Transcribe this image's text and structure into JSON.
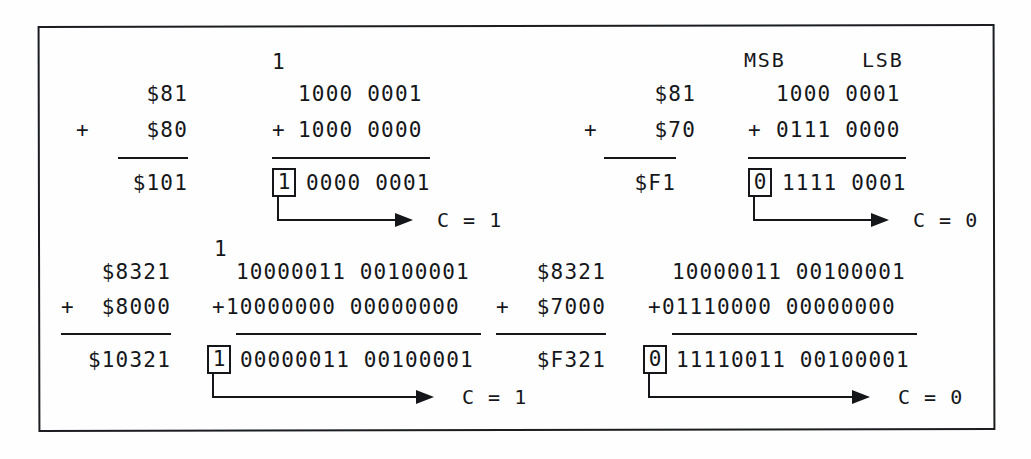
{
  "figure": {
    "border_color": "#1b1d20",
    "ink_color": "#14161a",
    "background": "#fefefe"
  },
  "headers": {
    "msb": "MSB",
    "lsb": "LSB"
  },
  "examples": [
    {
      "id": "ex1",
      "hex": {
        "augend": "$81",
        "plus_sign": "+",
        "addend": "$80",
        "sum": "$101"
      },
      "binary": {
        "carry_in": "1",
        "augend": "1000 0001",
        "plus_sign": "+",
        "addend": "1000 0000",
        "carry_out": "1",
        "sum": "0000 0001"
      },
      "flag": "C = 1"
    },
    {
      "id": "ex2",
      "hex": {
        "augend": "$81",
        "plus_sign": "+",
        "addend": "$70",
        "sum": "$F1"
      },
      "binary": {
        "carry_in": "",
        "augend": "1000 0001",
        "plus_sign": "+",
        "addend": "0111 0000",
        "carry_out": "0",
        "sum": "1111 0001"
      },
      "flag": "C = 0"
    },
    {
      "id": "ex3",
      "hex": {
        "augend": "$8321",
        "plus_sign": "+",
        "addend": "$8000",
        "sum": "$10321"
      },
      "binary": {
        "carry_in": "1",
        "augend": "10000011 00100001",
        "plus_sign": "+",
        "addend": "10000000 00000000",
        "carry_out": "1",
        "sum": "00000011 00100001"
      },
      "flag": "C = 1"
    },
    {
      "id": "ex4",
      "hex": {
        "augend": "$8321",
        "plus_sign": "+",
        "addend": "$7000",
        "sum": "$F321"
      },
      "binary": {
        "carry_in": "",
        "augend": "10000011 00100001",
        "plus_sign": "+",
        "addend": "01110000 00000000",
        "carry_out": "0",
        "sum": "11110011 00100001"
      },
      "flag": "C = 0"
    }
  ]
}
